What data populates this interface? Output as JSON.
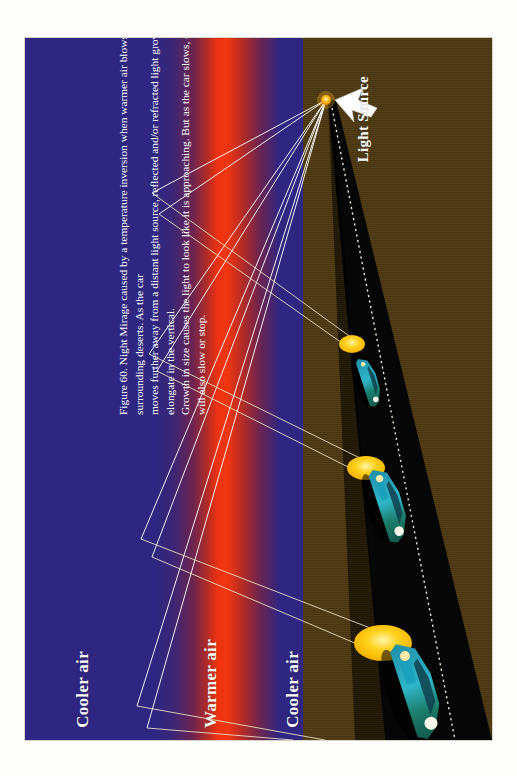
{
  "figure": {
    "number": "Figure 60.",
    "caption_full": "Figure 60.  Night Mirage caused by a temperature inversion when warmer air blows in from surrounding deserts.  As the car moves further away from a distant light source, reflected and/or refracted light grows in size and may elongate in the vertical.  Growth in size causes the light to look like it is approaching.  But as the car slows, or stops, the mirage will also slow or stop.",
    "caption_lines": [
      "Figure 60.  Night Mirage caused by a temperature inversion when warmer air blows in from surrounding deserts.  As the car",
      "moves further away from a distant light source, reflected and/or refracted light grows in size and may elongate in the vertical.",
      "Growth in size causes the light to look like it is approaching.  But as the car slows, or stops, the mirage will also slow or stop."
    ]
  },
  "labels": {
    "cooler_air_left": "Cooler air",
    "warmer_air": "Warmer air",
    "cooler_air_right": "Cooler air",
    "light_source": "Light Source"
  },
  "colors": {
    "cool_air": "#2e2680",
    "warm_air": "#ee3211",
    "desert": "#4f3a11",
    "road": "#050505",
    "mirage": "#ffd21e",
    "light_source_dot": "#ffb515",
    "ray": "#ffffff",
    "label_text": "#ffffff",
    "page_background": "#ffffff"
  },
  "scene": {
    "light_source": {
      "label": "Light Source",
      "x": 301,
      "y": 60,
      "radius": 5
    },
    "arrow": {
      "name": "light-source-pointer",
      "tip_x": 310,
      "tip_y": 63,
      "tail_x": 352,
      "tail_y": 78
    },
    "mirage_images": [
      {
        "index": 1,
        "rx": 13,
        "ry": 9,
        "cx": 327,
        "cy": 306,
        "note": "smallest mirage, farthest car"
      },
      {
        "index": 2,
        "rx": 19,
        "ry": 12,
        "cx": 341,
        "cy": 430,
        "note": "medium mirage"
      },
      {
        "index": 3,
        "rx": 28,
        "ry": 17,
        "cx": 358,
        "cy": 605,
        "note": "largest mirage, nearest car"
      }
    ],
    "cars": [
      {
        "index": 1,
        "cx": 344,
        "cy": 344,
        "scale": 0.55,
        "note": "farthest car"
      },
      {
        "index": 2,
        "cx": 364,
        "cy": 467,
        "scale": 0.8,
        "note": "middle car"
      },
      {
        "index": 3,
        "cx": 392,
        "cy": 652,
        "scale": 1.0,
        "note": "nearest car"
      }
    ],
    "ray_count": 8,
    "reflection_points": [
      {
        "x": 127,
        "y": 155
      },
      {
        "x": 134,
        "y": 175
      },
      {
        "x": 124,
        "y": 315
      },
      {
        "x": 131,
        "y": 332
      },
      {
        "x": 118,
        "y": 500
      },
      {
        "x": 126,
        "y": 518
      }
    ]
  }
}
